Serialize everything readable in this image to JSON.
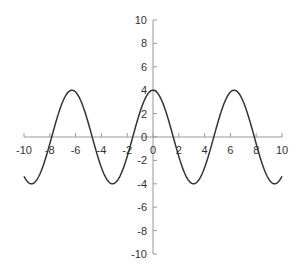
{
  "chart_data": {
    "type": "line",
    "title": "",
    "xlabel": "",
    "ylabel": "",
    "function": "y = 4cos(x)",
    "xlim": [
      -10,
      10
    ],
    "ylim": [
      -10,
      10
    ],
    "grid": false,
    "legend": null,
    "x_ticks": [
      "-10",
      "-8",
      "-6",
      "-4",
      "-2",
      "0",
      "2",
      "4",
      "6",
      "8",
      "10"
    ],
    "y_ticks": [
      "10",
      "8",
      "6",
      "4",
      "2",
      "0",
      "-2",
      "-4",
      "-6",
      "-8",
      "-10"
    ],
    "series": [
      {
        "name": "y",
        "color": "#333333",
        "x": [
          -10,
          -9,
          -8,
          -7,
          -6,
          -5,
          -4,
          -3,
          -2,
          -1,
          0,
          1,
          2,
          3,
          4,
          5,
          6,
          7,
          8,
          9,
          10
        ],
        "values": [
          -3.36,
          -3.64,
          -0.58,
          3.02,
          3.84,
          1.13,
          -2.61,
          -3.96,
          -1.66,
          2.16,
          4.0,
          2.16,
          -1.66,
          -3.96,
          -2.61,
          1.13,
          3.84,
          3.02,
          -0.58,
          -3.64,
          -3.36
        ]
      }
    ]
  }
}
